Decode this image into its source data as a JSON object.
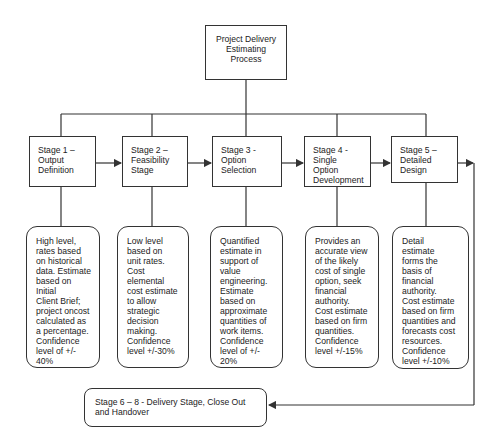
{
  "diagram": {
    "root": {
      "label": "Project Delivery Estimating Process"
    },
    "stages": [
      {
        "id": "stage1",
        "label": "Stage 1 –\nOutput\nDefinition",
        "description": "High level,\nrates based\non historical\ndata. Estimate\nbased on Initial\nClient Brief;\nproject oncost\ncalculated as\na percentage.\nConfidence\nlevel of +/-\n40%"
      },
      {
        "id": "stage2",
        "label": "Stage 2 –\nFeasibility\nStage",
        "description": "Low level\nbased on\nunit rates.\nCost\nelemental\ncost estimate\nto allow\nstrategic\ndecision\nmaking.\nConfidence\nlevel +/-30%"
      },
      {
        "id": "stage3",
        "label": "Stage 3 - Option\nSelection",
        "description": "Quantified\nestimate in\nsupport of\nvalue\nengineering.\nEstimate\nbased on\napproximate\nquantities of\nwork items.\nConfidence\nlevel of +/-\n20%"
      },
      {
        "id": "stage4",
        "label": "Stage 4 -\nSingle Option\nDevelopment",
        "description": "Provides an\naccurate view\nof the likely\ncost of single\noption, seek\nfinancial\nauthority.\nCost estimate\nbased on firm\nquantities.\nConfidence\nlevel +/-15%"
      },
      {
        "id": "stage5",
        "label": "Stage 5 –\nDetailed\nDesign",
        "description": "Detail\nestimate\nforms the\nbasis of\nfinancial\nauthority.\nCost estimate\nbased on firm\nquantities and\nforecasts cost\nresources.\nConfidence\nlevel +/-10%"
      }
    ],
    "final": {
      "label": "Stage 6 – 8 - Delivery Stage, Close Out\nand Handover"
    },
    "colors": {
      "line": "#333333",
      "background": "#ffffff",
      "text": "#222222"
    }
  }
}
